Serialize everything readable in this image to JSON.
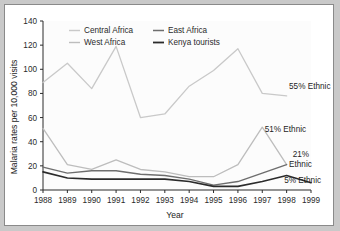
{
  "chart_data": {
    "type": "line",
    "title": "",
    "xlabel": "Year",
    "ylabel": "Malaria rates per 10,000 visits",
    "x": [
      1988,
      1989,
      1990,
      1991,
      1992,
      1993,
      1994,
      1995,
      1996,
      1997,
      1998,
      1999
    ],
    "xlim": [
      1988,
      1999
    ],
    "ylim": [
      0,
      140
    ],
    "yticks": [
      0,
      20,
      40,
      60,
      80,
      100,
      120,
      140
    ],
    "xticks": [
      "1988",
      "1989",
      "1990",
      "1991",
      "1992",
      "1993",
      "1994",
      "1995",
      "1996",
      "1997",
      "1998",
      "1999"
    ],
    "grid": false,
    "legend_position": "top-left-inside",
    "series": [
      {
        "name": "Central Africa",
        "color": "#c9c9c9",
        "values": [
          89,
          105,
          84,
          119,
          60,
          63,
          86,
          99,
          117,
          80,
          78,
          null
        ]
      },
      {
        "name": "West Africa",
        "color": "#bdbdbd",
        "values": [
          51,
          21,
          17,
          25,
          17,
          15,
          11,
          11,
          21,
          52,
          21,
          null
        ]
      },
      {
        "name": "East Africa",
        "color": "#6e6e6e",
        "values": [
          19,
          14,
          16,
          16,
          13,
          12,
          9,
          4,
          7,
          14,
          21,
          null
        ]
      },
      {
        "name": "Kenya tourists",
        "color": "#2b2b2b",
        "values": [
          15,
          10,
          9,
          9,
          9,
          9,
          7,
          3,
          3,
          7,
          12,
          6
        ]
      }
    ],
    "annotations": [
      {
        "label": "55% Ethnic",
        "series": "Central Africa",
        "x": 1998.1,
        "y": 84
      },
      {
        "label": "51% Ethnic",
        "series": "West Africa",
        "x": 1997.1,
        "y": 48
      },
      {
        "label": "21%",
        "series": "East Africa",
        "x": 1998.25,
        "y": 27
      },
      {
        "label": "Ethnic",
        "series": "East Africa",
        "x": 1998.1,
        "y": 19
      },
      {
        "label": "5% Ethnic",
        "series": "Kenya tourists",
        "x": 1997.9,
        "y": 6
      }
    ]
  }
}
